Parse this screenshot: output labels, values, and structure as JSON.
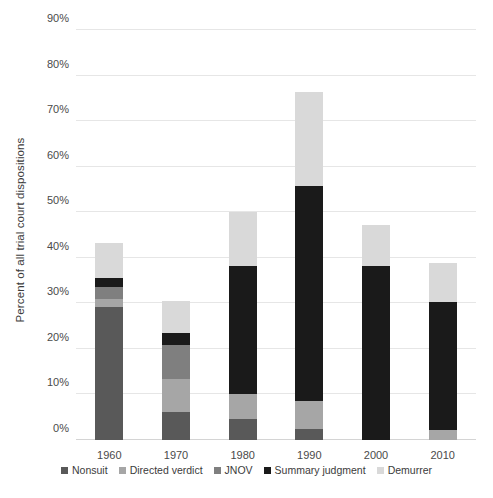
{
  "chart_data": {
    "type": "bar",
    "subtype": "stacked-bar",
    "title": "",
    "xlabel": "",
    "ylabel": "Percent of all trial court dispositions",
    "categories": [
      "1960",
      "1970",
      "1980",
      "1990",
      "2000",
      "2010"
    ],
    "ylim": [
      0,
      90
    ],
    "ytick_labels": [
      "0%",
      "10%",
      "20%",
      "30%",
      "40%",
      "50%",
      "60%",
      "70%",
      "80%",
      "90%"
    ],
    "ytick_values": [
      0,
      10,
      20,
      30,
      40,
      50,
      60,
      70,
      80,
      90
    ],
    "grid": true,
    "legend_position": "bottom",
    "stack_order_bottom_to_top": [
      "Nonsuit",
      "Directed verdict",
      "JNOV",
      "Summary judgment",
      "Demurrer"
    ],
    "series": [
      {
        "name": "Nonsuit",
        "color": "#595959",
        "values": [
          29.2,
          6.1,
          4.7,
          2.5,
          0.0,
          0.0
        ]
      },
      {
        "name": "Directed verdict",
        "color": "#a6a6a6",
        "values": [
          1.7,
          7.4,
          5.3,
          6.0,
          0.0,
          2.3
        ]
      },
      {
        "name": "JNOV",
        "color": "#7f7f7f",
        "values": [
          2.7,
          7.3,
          0.0,
          0.0,
          0.0,
          0.0
        ]
      },
      {
        "name": "Summary judgment",
        "color": "#1a1a1a",
        "values": [
          1.9,
          2.6,
          28.3,
          47.3,
          38.3,
          27.9
        ]
      },
      {
        "name": "Demurrer",
        "color": "#d9d9d9",
        "values": [
          7.7,
          7.1,
          11.7,
          20.5,
          9.0,
          8.6
        ]
      }
    ],
    "totals": [
      43.2,
      30.5,
      50.0,
      76.3,
      47.3,
      38.8
    ]
  },
  "legend": {
    "items": [
      {
        "label": "Nonsuit",
        "color": "#595959"
      },
      {
        "label": "Directed verdict",
        "color": "#a6a6a6"
      },
      {
        "label": "JNOV",
        "color": "#7f7f7f"
      },
      {
        "label": "Summary judgment",
        "color": "#1a1a1a"
      },
      {
        "label": "Demurrer",
        "color": "#d9d9d9"
      }
    ]
  },
  "colors": {
    "background": "#ffffff",
    "gridline": "#e6e6e6",
    "baseline": "#d4d4d4",
    "tick_text": "#4a4a4a",
    "axis_title_text": "#3b3b3b"
  }
}
